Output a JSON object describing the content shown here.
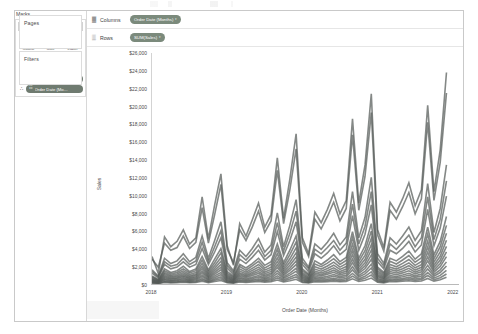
{
  "window": {
    "left_panel": {
      "pages_shelf": {
        "title": "Pages"
      },
      "filters_shelf": {
        "title": "Filters"
      },
      "marks_card": {
        "title": "Marks",
        "mark_type": {
          "label": "Automatic",
          "glyph": "↗",
          "caret": "▾"
        },
        "property_buttons": [
          {
            "label": "Colour",
            "icon": "░",
            "icon_name": "colour-icon"
          },
          {
            "label": "Size",
            "icon": "◔",
            "icon_name": "size-icon"
          },
          {
            "label": "Label",
            "icon": "▧",
            "icon_name": "label-icon"
          },
          {
            "label": "Detail",
            "icon": "∴",
            "icon_name": "detail-icon"
          },
          {
            "label": "Tooltip",
            "icon": "⬜",
            "icon_name": "tooltip-icon"
          },
          {
            "label": "Path",
            "icon": "〜",
            "icon_name": "path-icon"
          }
        ],
        "pills": [
          {
            "lead_icon": "∴",
            "icon": "▦",
            "text": "SUM(Categ…"
          },
          {
            "lead_icon": "∴",
            "icon": "☷",
            "text": "Order Date (Mo…"
          }
        ]
      }
    },
    "shelves": [
      {
        "grip": "▓",
        "label": "Columns",
        "pill": {
          "text": "Order Date (Months)",
          "caret": "▾"
        }
      },
      {
        "grip": "▒",
        "label": "Rows",
        "pill": {
          "text": "SUM(Sales)",
          "caret": "▾"
        }
      }
    ]
  },
  "chart_data": {
    "type": "line",
    "title": "",
    "subtitle": "",
    "xlabel": "Order Date (Months)",
    "ylabel": "Sales",
    "grid": false,
    "legend": "none",
    "ylim": [
      0,
      26000
    ],
    "y_ticks": [
      "$26,000",
      "$24,000",
      "$22,000",
      "$20,000",
      "$18,000",
      "$16,000",
      "$14,000",
      "$12,000",
      "$10,000",
      "$8,000",
      "$6,000",
      "$4,000",
      "$2,000",
      "$0"
    ],
    "y_tick_values": [
      26000,
      24000,
      22000,
      20000,
      18000,
      16000,
      14000,
      12000,
      10000,
      8000,
      6000,
      4000,
      2000,
      0
    ],
    "x_ticks": [
      "2018",
      "2019",
      "2020",
      "2021",
      "2022"
    ],
    "x_tick_values": [
      0,
      12,
      24,
      36,
      48
    ],
    "x_range": [
      0,
      49
    ],
    "note": "Monthly SUM(Sales) broken down by many sub-categories; 17 overlapping grey lines across Jan-2018 to Dec-2021.",
    "series": [
      {
        "name": "Phones",
        "values": [
          3100,
          1200,
          5300,
          4200,
          4800,
          6100,
          4500,
          5200,
          9800,
          5100,
          8900,
          12400,
          4300,
          2100,
          6800,
          5400,
          7200,
          9100,
          6400,
          7800,
          14200,
          7400,
          11800,
          16900,
          5200,
          3400,
          8100,
          6900,
          8400,
          10200,
          7900,
          9400,
          18600,
          9100,
          13400,
          21400,
          6100,
          4100,
          9200,
          8100,
          9600,
          11400,
          8800,
          10600,
          20100,
          10400,
          15100,
          23800
        ]
      },
      {
        "name": "Chairs",
        "values": [
          2800,
          1900,
          4600,
          3800,
          4100,
          5400,
          4000,
          4700,
          8600,
          4600,
          7800,
          11200,
          3900,
          2400,
          6100,
          4900,
          6400,
          8200,
          5800,
          7100,
          12800,
          6800,
          10600,
          15200,
          4700,
          3100,
          7300,
          6200,
          7600,
          9200,
          7100,
          8500,
          16800,
          8300,
          12100,
          19300,
          5500,
          3700,
          8300,
          7300,
          8700,
          10300,
          7900,
          9600,
          18200,
          9400,
          13700,
          21500
        ]
      },
      {
        "name": "Storage",
        "values": [
          1600,
          900,
          2900,
          2300,
          2600,
          3400,
          2500,
          3000,
          5400,
          2900,
          4900,
          7000,
          2400,
          1500,
          3800,
          3100,
          4000,
          5100,
          3600,
          4400,
          8000,
          4200,
          6600,
          9500,
          2900,
          1900,
          4500,
          3900,
          4700,
          5700,
          4400,
          5300,
          10400,
          5200,
          7500,
          12000,
          3400,
          2300,
          5200,
          4500,
          5400,
          6400,
          4900,
          6000,
          11300,
          5800,
          8500,
          13400
        ]
      },
      {
        "name": "Tables",
        "values": [
          1400,
          800,
          2500,
          2000,
          2200,
          2900,
          2200,
          2600,
          4700,
          2500,
          4200,
          6000,
          2100,
          1300,
          3300,
          2700,
          3500,
          4400,
          3100,
          3800,
          6900,
          3700,
          5700,
          8200,
          2500,
          1700,
          3900,
          3400,
          4100,
          4900,
          3800,
          4600,
          9000,
          4500,
          6500,
          10400,
          2900,
          2000,
          4500,
          3900,
          4700,
          5500,
          4200,
          5200,
          9800,
          5000,
          7300,
          11600
        ]
      },
      {
        "name": "Binders",
        "values": [
          1200,
          700,
          2200,
          1700,
          1900,
          2500,
          1900,
          2200,
          4000,
          2200,
          3600,
          5200,
          1800,
          1100,
          2800,
          2300,
          3000,
          3800,
          2700,
          3300,
          5900,
          3200,
          4900,
          7000,
          2200,
          1400,
          3400,
          2900,
          3500,
          4300,
          3300,
          3900,
          7700,
          3800,
          5600,
          8900,
          2500,
          1700,
          3800,
          3400,
          4000,
          4800,
          3600,
          4400,
          8400,
          4300,
          6300,
          9900
        ]
      },
      {
        "name": "Machines",
        "values": [
          900,
          500,
          1700,
          1300,
          1500,
          2000,
          1400,
          1700,
          3100,
          1600,
          2800,
          4000,
          1400,
          900,
          2200,
          1800,
          2300,
          2900,
          2100,
          2500,
          4500,
          2400,
          3800,
          5400,
          1700,
          1100,
          2600,
          2200,
          2700,
          3300,
          2500,
          3000,
          5900,
          2900,
          4300,
          6800,
          1900,
          1300,
          2900,
          2600,
          3100,
          3700,
          2800,
          3400,
          6400,
          3300,
          4800,
          7600
        ]
      },
      {
        "name": "Accessories",
        "values": [
          800,
          450,
          1500,
          1150,
          1300,
          1700,
          1250,
          1500,
          2700,
          1400,
          2400,
          3500,
          1200,
          800,
          1950,
          1550,
          2050,
          2550,
          1800,
          2200,
          3950,
          2100,
          3300,
          4700,
          1500,
          1000,
          2250,
          1950,
          2350,
          2850,
          2200,
          2650,
          5200,
          2550,
          3750,
          5950,
          1700,
          1150,
          2550,
          2250,
          2700,
          3200,
          2450,
          2950,
          5600,
          2850,
          4200,
          6600
        ]
      },
      {
        "name": "Copiers",
        "values": [
          700,
          380,
          1300,
          980,
          1120,
          1480,
          1080,
          1280,
          2320,
          1200,
          2060,
          2980,
          1040,
          680,
          1680,
          1340,
          1760,
          2200,
          1560,
          1900,
          3420,
          1800,
          2840,
          4060,
          1280,
          840,
          1940,
          1680,
          2020,
          2460,
          1900,
          2280,
          4480,
          2200,
          3220,
          5120,
          1460,
          1000,
          2200,
          1940,
          2320,
          2760,
          2100,
          2540,
          4820,
          2460,
          3620,
          5700
        ]
      },
      {
        "name": "Bookcases",
        "values": [
          600,
          330,
          1120,
          840,
          960,
          1280,
          920,
          1100,
          2000,
          1040,
          1780,
          2560,
          900,
          580,
          1450,
          1160,
          1520,
          1900,
          1340,
          1640,
          2940,
          1560,
          2440,
          3500,
          1100,
          720,
          1680,
          1440,
          1740,
          2120,
          1640,
          1960,
          3860,
          1900,
          2780,
          4400,
          1260,
          860,
          1900,
          1680,
          2000,
          2380,
          1820,
          2180,
          4160,
          2120,
          3120,
          4920
        ]
      },
      {
        "name": "Appliances",
        "values": [
          520,
          290,
          960,
          730,
          830,
          1100,
          800,
          950,
          1720,
          900,
          1540,
          2200,
          780,
          500,
          1250,
          1000,
          1300,
          1640,
          1160,
          1420,
          2540,
          1340,
          2100,
          3020,
          960,
          620,
          1450,
          1240,
          1500,
          1820,
          1400,
          1700,
          3320,
          1640,
          2400,
          3800,
          1080,
          740,
          1640,
          1450,
          1720,
          2060,
          1570,
          1880,
          3580,
          1830,
          2700,
          4240
        ]
      },
      {
        "name": "Furnishings",
        "values": [
          440,
          250,
          830,
          620,
          710,
          940,
          680,
          810,
          1460,
          770,
          1320,
          1880,
          670,
          430,
          1070,
          860,
          1120,
          1400,
          990,
          1210,
          2170,
          1140,
          1790,
          2580,
          820,
          530,
          1240,
          1060,
          1280,
          1550,
          1200,
          1450,
          2840,
          1400,
          2050,
          3250,
          920,
          630,
          1400,
          1240,
          1470,
          1760,
          1340,
          1610,
          3060,
          1560,
          2310,
          3620
        ]
      },
      {
        "name": "Paper",
        "values": [
          380,
          210,
          700,
          530,
          600,
          800,
          580,
          690,
          1250,
          650,
          1120,
          1600,
          570,
          370,
          910,
          730,
          950,
          1190,
          840,
          1030,
          1850,
          970,
          1520,
          2190,
          700,
          450,
          1050,
          900,
          1090,
          1320,
          1020,
          1230,
          2410,
          1190,
          1740,
          2760,
          780,
          540,
          1190,
          1050,
          1250,
          1490,
          1140,
          1370,
          2600,
          1330,
          1960,
          3080
        ]
      },
      {
        "name": "Supplies",
        "values": [
          310,
          170,
          580,
          430,
          490,
          650,
          470,
          560,
          1010,
          530,
          910,
          1300,
          460,
          300,
          740,
          590,
          770,
          960,
          680,
          830,
          1500,
          790,
          1230,
          1770,
          570,
          370,
          850,
          730,
          880,
          1070,
          830,
          1000,
          1950,
          960,
          1410,
          2230,
          630,
          430,
          960,
          850,
          1010,
          1210,
          920,
          1110,
          2100,
          1080,
          1590,
          2490
        ]
      },
      {
        "name": "Art",
        "values": [
          250,
          140,
          470,
          350,
          400,
          530,
          380,
          450,
          820,
          430,
          740,
          1050,
          370,
          240,
          600,
          480,
          620,
          780,
          550,
          670,
          1210,
          640,
          1000,
          1430,
          460,
          300,
          690,
          590,
          710,
          870,
          670,
          810,
          1580,
          780,
          1140,
          1800,
          510,
          350,
          780,
          690,
          820,
          980,
          750,
          900,
          1700,
          870,
          1290,
          2020
        ]
      },
      {
        "name": "Labels",
        "values": [
          190,
          100,
          350,
          260,
          300,
          400,
          290,
          340,
          620,
          320,
          560,
          790,
          280,
          180,
          450,
          360,
          470,
          590,
          410,
          510,
          910,
          480,
          750,
          1080,
          350,
          220,
          520,
          450,
          540,
          650,
          510,
          610,
          1190,
          590,
          860,
          1360,
          380,
          260,
          590,
          520,
          620,
          740,
          560,
          680,
          1280,
          660,
          970,
          1520
        ]
      },
      {
        "name": "Envelopes",
        "values": [
          140,
          75,
          260,
          195,
          220,
          295,
          215,
          255,
          460,
          240,
          415,
          590,
          205,
          135,
          335,
          265,
          350,
          435,
          310,
          375,
          675,
          355,
          560,
          800,
          255,
          165,
          385,
          330,
          400,
          485,
          375,
          450,
          880,
          435,
          635,
          1000,
          285,
          195,
          435,
          385,
          460,
          550,
          420,
          505,
          950,
          485,
          715,
          1130
        ]
      },
      {
        "name": "Fasteners",
        "values": [
          90,
          50,
          170,
          130,
          145,
          195,
          140,
          170,
          305,
          160,
          275,
          390,
          135,
          90,
          220,
          175,
          230,
          290,
          205,
          250,
          445,
          235,
          370,
          530,
          170,
          110,
          255,
          220,
          265,
          320,
          250,
          300,
          585,
          290,
          420,
          665,
          190,
          130,
          290,
          255,
          305,
          365,
          280,
          335,
          630,
          325,
          475,
          750
        ]
      }
    ]
  }
}
